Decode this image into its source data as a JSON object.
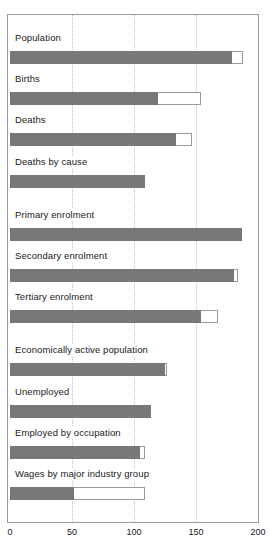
{
  "chart_data": {
    "type": "bar",
    "orientation": "horizontal",
    "title": "",
    "xlabel": "",
    "ylabel": "",
    "xlim": [
      0,
      200
    ],
    "xticks": [
      0,
      50,
      100,
      150,
      200
    ],
    "xtick_labels": [
      "0",
      "50",
      "100",
      "150",
      "200"
    ],
    "grid": true,
    "gridlines_at": [
      50,
      100,
      150
    ],
    "legend": "none",
    "categories": [
      "Population",
      "Births",
      "Deaths",
      "Deaths by cause",
      "Primary enrolment",
      "Secondary enrolment",
      "Tertiary enrolment",
      "Economically active population",
      "Unemployed",
      "Employed by occupation",
      "Wages by major industry group"
    ],
    "series": [
      {
        "name": "value",
        "style": "solid-gray",
        "color": "#787878",
        "values": [
          179,
          119,
          134,
          109,
          187,
          181,
          154,
          125,
          114,
          105,
          52
        ]
      },
      {
        "name": "total",
        "style": "outline",
        "color": "#ffffff",
        "values": [
          188,
          154,
          147,
          109,
          187,
          184,
          168,
          127,
          114,
          109,
          109
        ]
      }
    ],
    "groups": [
      {
        "name": "vital-statistics",
        "categories": [
          "Population",
          "Births",
          "Deaths",
          "Deaths by cause"
        ]
      },
      {
        "name": "education",
        "categories": [
          "Primary enrolment",
          "Secondary enrolment",
          "Tertiary enrolment"
        ]
      },
      {
        "name": "labour",
        "categories": [
          "Economically active population",
          "Unemployed",
          "Employed by occupation",
          "Wages by major industry group"
        ]
      }
    ]
  },
  "colors": {
    "bar_fill": "#787878",
    "bar_outline": "#9a9a9a",
    "frame": "#9a9a9a",
    "gridline": "#c0c0c0",
    "text": "#1a1a1a",
    "background": "#ffffff"
  }
}
